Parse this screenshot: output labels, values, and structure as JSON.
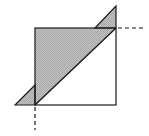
{
  "diagram": {
    "colors": {
      "stroke": "#1a1a1a",
      "fill": "#b8b8b8",
      "background": "#ffffff"
    },
    "square": {
      "x": 35,
      "y": 28,
      "width": 81,
      "height": 77
    },
    "shaded_main_triangle": [
      [
        35,
        28
      ],
      [
        116,
        28
      ],
      [
        35,
        105
      ]
    ],
    "shaded_top_triangle": [
      [
        95,
        28
      ],
      [
        116,
        6
      ],
      [
        116,
        28
      ]
    ],
    "shaded_bottom_triangle": [
      [
        15,
        105
      ],
      [
        35,
        85
      ],
      [
        35,
        105
      ]
    ],
    "diagonal": [
      [
        35,
        105
      ],
      [
        116,
        28
      ]
    ],
    "dashed_horizontal": [
      [
        116,
        28
      ],
      [
        146,
        28
      ]
    ],
    "dashed_vertical": [
      [
        35,
        105
      ],
      [
        35,
        130
      ]
    ]
  }
}
